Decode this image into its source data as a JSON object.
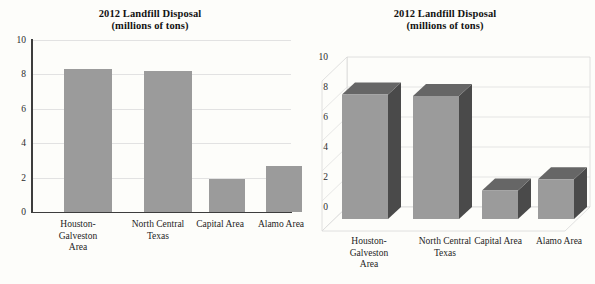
{
  "page": {
    "background_color": "#fdfdfa",
    "bar_fill_color": "#9b9b9b",
    "bar_top_color": "#666666",
    "bar_side_color": "#4a4a4a",
    "gridline_color": "#e2e2e2",
    "axis_color": "#3d3d3d"
  },
  "charts": [
    {
      "id": "left-2d-bar-chart",
      "title_line1": "2012 Landfill Disposal",
      "title_line2": "(millions of tons)"
    },
    {
      "id": "right-3d-bar-chart",
      "title_line1": "2012 Landfill Disposal",
      "title_line2": "(millions of tons)"
    }
  ],
  "chart_data": [
    {
      "type": "bar",
      "title": "2012 Landfill Disposal (millions of tons)",
      "subtitle": "(millions of tons)",
      "xlabel": "",
      "ylabel": "",
      "ylim": [
        0,
        10
      ],
      "yticks": [
        0,
        2,
        4,
        6,
        8,
        10
      ],
      "ytick_labels": [
        "0",
        "2",
        "4",
        "6",
        "8",
        "10"
      ],
      "grid": true,
      "legend": "none",
      "style": "2d-flat",
      "categories": [
        "Houston-\nGalveston\nArea",
        "North Central\nTexas",
        "Capital Area",
        "Alamo Area"
      ],
      "category_labels": [
        "Houston-Galveston Area",
        "North Central Texas",
        "Capital Area",
        "Alamo Area"
      ],
      "values": [
        8.3,
        8.2,
        1.9,
        2.65
      ]
    },
    {
      "type": "bar",
      "title": "2012 Landfill Disposal (millions of tons)",
      "subtitle": "(millions of tons)",
      "xlabel": "",
      "ylabel": "",
      "ylim": [
        0,
        10
      ],
      "yticks": [
        0,
        2,
        4,
        6,
        8,
        10
      ],
      "ytick_labels": [
        "0",
        "2",
        "4",
        "6",
        "8",
        "10"
      ],
      "grid": true,
      "legend": "none",
      "style": "3d-perspective",
      "categories": [
        "Houston-\nGalveston\nArea",
        "North Central\nTexas",
        "Capital Area",
        "Alamo Area"
      ],
      "category_labels": [
        "Houston-Galveston Area",
        "North Central Texas",
        "Capital Area",
        "Alamo Area"
      ],
      "values": [
        8.3,
        8.2,
        1.9,
        2.65
      ]
    }
  ]
}
